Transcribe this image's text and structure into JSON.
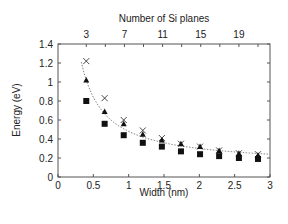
{
  "chart_data": {
    "type": "scatter",
    "title": "",
    "xlabel": "Width (nm)",
    "ylabel": "Energy (eV)",
    "top_xlabel": "Number of Si planes",
    "xlim": [
      0,
      3
    ],
    "ylim": [
      0,
      1.4
    ],
    "x_ticks": [
      "0",
      "0.5",
      "1",
      "1.5",
      "2",
      "2.5",
      "3"
    ],
    "y_ticks": [
      "0",
      "0.2",
      "0.4",
      "0.6",
      "0.8",
      "1",
      "1.2",
      "1.4"
    ],
    "top_ticks": [
      "3",
      "7",
      "11",
      "15",
      "19"
    ],
    "grid": false,
    "legend": "none",
    "x": [
      0.4,
      0.66,
      0.93,
      1.2,
      1.47,
      1.74,
      2.01,
      2.28,
      2.56,
      2.83
    ],
    "si_planes": [
      3,
      5,
      7,
      9,
      11,
      13,
      15,
      17,
      19,
      21
    ],
    "series": [
      {
        "name": "cross",
        "marker": "x",
        "values": [
          1.22,
          0.83,
          0.6,
          0.49,
          0.41,
          0.35,
          0.32,
          0.28,
          0.25,
          0.24
        ]
      },
      {
        "name": "triangle",
        "marker": "triangle",
        "values": [
          1.02,
          0.69,
          0.56,
          0.45,
          0.39,
          0.35,
          0.32,
          0.28,
          0.25,
          0.23
        ]
      },
      {
        "name": "square",
        "marker": "square",
        "values": [
          0.8,
          0.56,
          0.44,
          0.36,
          0.32,
          0.27,
          0.24,
          0.22,
          0.2,
          0.19
        ]
      }
    ],
    "fit_curve": {
      "style": "dotted",
      "description": "1/width-type fit through cross markers"
    }
  }
}
